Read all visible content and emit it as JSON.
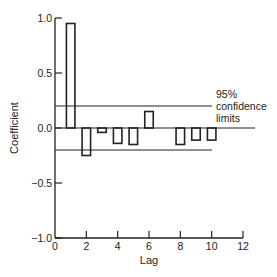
{
  "chart_data": {
    "type": "bar",
    "title": "",
    "xlabel": "Lag",
    "ylabel": "Coefficient",
    "xlim": [
      0,
      12
    ],
    "ylim": [
      -1.0,
      1.0
    ],
    "x_ticks": [
      "0",
      "2",
      "4",
      "6",
      "8",
      "10",
      "12"
    ],
    "y_ticks": [
      "1.0",
      "0.5",
      "0.0",
      "-0.5",
      "-1.0"
    ],
    "categories": [
      1,
      2,
      3,
      4,
      5,
      6,
      7,
      8,
      9,
      10
    ],
    "values": [
      0.95,
      -0.25,
      -0.04,
      -0.14,
      -0.15,
      0.15,
      0.0,
      -0.15,
      -0.11,
      -0.11
    ],
    "confidence_limits": [
      0.2,
      -0.2
    ],
    "annotation": {
      "line1": "95%",
      "line2": "confidence",
      "line3": "limits"
    },
    "grid": false,
    "bar_style": "outline"
  }
}
